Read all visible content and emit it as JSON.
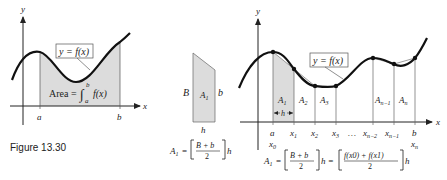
{
  "figure": {
    "caption": "Figure 13.30",
    "colors": {
      "shade": "#dcdcdc",
      "curve": "#111111",
      "axis": "#222222"
    }
  },
  "left_graph": {
    "y_axis_label": "y",
    "x_axis_label": "x",
    "function_label": "y = f(x)",
    "tick_a": "a",
    "tick_b": "b",
    "area_prefix": "Area = ",
    "integral_sign": "∫",
    "integral_upper": "b",
    "integral_lower": "a",
    "integrand": "f(x)"
  },
  "trapezoid": {
    "left_side": "B",
    "right_side": "b",
    "area_label": "A",
    "area_sub": "1",
    "base_label": "h",
    "formula": {
      "lhs": "A",
      "lhs_sub": "1",
      "eq": " = ",
      "numerator": "B + b",
      "denominator": "2",
      "tail": "h"
    }
  },
  "right_graph": {
    "y_axis_label": "y",
    "x_axis_label": "x",
    "function_label": "y = f(x)",
    "regions": [
      "A1",
      "A2",
      "A3",
      "An−1",
      "An"
    ],
    "width_label": "h",
    "ticks_top": [
      "a",
      "x1",
      "x2",
      "x3",
      "…",
      "xn−2",
      "xn−1",
      "b"
    ],
    "ticks_bottom": [
      "x0",
      "xn"
    ],
    "formula": {
      "lhs": "A",
      "lhs_sub": "1",
      "eq1": " = ",
      "frac1_num": "B + b",
      "frac1_den": "2",
      "mid": "h = ",
      "frac2_num": "f(x0) + f(x1)",
      "frac2_den": "2",
      "tail": "h"
    }
  }
}
